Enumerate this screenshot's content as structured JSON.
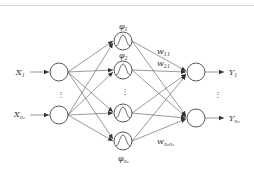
{
  "title_rule": {
    "color": "#d8d8d8"
  },
  "diagram": {
    "type": "RBF neural network",
    "input_layer": {
      "nodes": [
        {
          "label": "X",
          "subscript": "1"
        },
        {
          "label": "X",
          "subscript": "n₁"
        }
      ],
      "ellipsis": "⋮"
    },
    "hidden_layer": {
      "nodes": [
        {
          "label": "φ",
          "subscript": "1",
          "activation": "gaussian"
        },
        {
          "label": "φ",
          "subscript": "2",
          "activation": "gaussian"
        },
        {
          "label": "",
          "subscript": "",
          "activation": "gaussian"
        },
        {
          "label": "φ",
          "subscript": "n₂",
          "activation": "gaussian"
        }
      ],
      "ellipsis": "⋮"
    },
    "output_layer": {
      "nodes": [
        {
          "label": "Y",
          "subscript": "1"
        },
        {
          "label": "Y",
          "subscript": "n₃"
        }
      ],
      "ellipsis": "⋮"
    },
    "weights": [
      {
        "label": "w",
        "subscript": "11"
      },
      {
        "label": "w",
        "subscript": "21"
      },
      {
        "label": "w",
        "subscript": "n₂n₁"
      }
    ],
    "colors": {
      "stroke": "#444444",
      "edge": "#555555",
      "text": "#333333",
      "background": "#ffffff"
    }
  }
}
